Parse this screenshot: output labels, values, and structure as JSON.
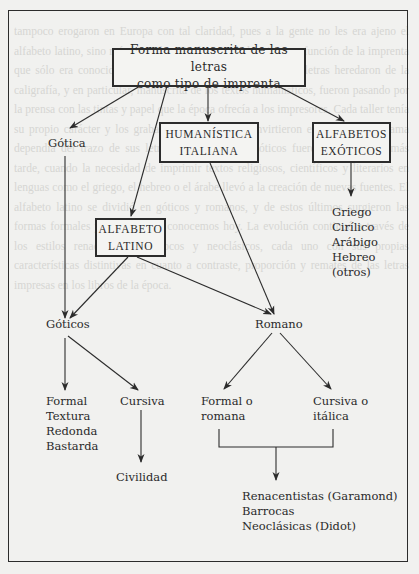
{
  "diagram": {
    "title_box": {
      "lines": [
        "Forma manuscrita de las letras",
        "como tipo de imprenta"
      ]
    },
    "nodes": {
      "gotica": "Gótica",
      "humanistica": {
        "lines": [
          "HUMANÍSTICA",
          "ITALIANA"
        ]
      },
      "exoticos": {
        "lines": [
          "ALFABETOS",
          "EXÓTICOS"
        ]
      },
      "latino": {
        "lines": [
          "ALFABETO",
          "LATINO"
        ]
      },
      "exoticos_list": [
        "Griego",
        "Cirílico",
        "Arábigo",
        "Hebreo",
        "(otros)"
      ],
      "goticos": "Góticos",
      "romano": "Romano",
      "formal_list": [
        "Formal",
        "Textura",
        "Redonda",
        "Bastarda"
      ],
      "cursiva": "Cursiva",
      "civilidad": "Civilidad",
      "formal_romana": [
        "Formal o",
        "romana"
      ],
      "cursiva_italica": [
        "Cursiva o",
        "itálica"
      ],
      "romano_styles": [
        "Renacentistas (Garamond)",
        "Barrocas",
        "Neoclásicas (Didot)"
      ]
    },
    "edges": [
      {
        "from": "title_box",
        "to": "gotica"
      },
      {
        "from": "title_box",
        "to": "latino"
      },
      {
        "from": "title_box",
        "to": "humanistica"
      },
      {
        "from": "title_box",
        "to": "exoticos"
      },
      {
        "from": "exoticos",
        "to": "exoticos_list"
      },
      {
        "from": "gotica",
        "to": "goticos"
      },
      {
        "from": "latino",
        "to": "goticos"
      },
      {
        "from": "latino",
        "to": "romano"
      },
      {
        "from": "humanistica",
        "to": "romano"
      },
      {
        "from": "goticos",
        "to": "formal_list"
      },
      {
        "from": "goticos",
        "to": "cursiva"
      },
      {
        "from": "cursiva",
        "to": "civilidad"
      },
      {
        "from": "romano",
        "to": "formal_romana"
      },
      {
        "from": "romano",
        "to": "cursiva_italica"
      },
      {
        "from": "formal_romana+cursiva_italica",
        "to": "romano_styles"
      }
    ]
  },
  "background": {
    "text": "tampoco erogaron en Europa con tal claridad, pues a la gente no les era ajeno el alfabeto latino, sino más bien el particular uso de los tipos en función de la imprenta que sólo era conocido por unos cuantos. Las formas de las letras heredaron de la caligrafía, y en particular, manuscrita de los textos humanísticos, fueron pasando por la prensa con las tintas y papel que la época ofrecía a los impresores. Cada taller tenía su propio carácter y los grabadores de tipos se convirtieron en artistas cuya fama dependía del trazo de sus letras. Los alfabetos exóticos fueron introducidos más tarde, cuando la necesidad de imprimir textos religiosos, científicos y literarios en lenguas como el griego, el hebreo o el árabe llevó a la creación de nuevas fuentes. El alfabeto latino se dividió en góticos y romanos, y de estos últimos surgieron las formas formales y cursivas que conocemos hoy. La evolución continuó a través de los estilos renacentistas, barrocos y neoclásicos, cada uno con sus propias características distintivas en cuanto a contraste, proporción y remates de las letras impresas en los libros de la época."
  }
}
